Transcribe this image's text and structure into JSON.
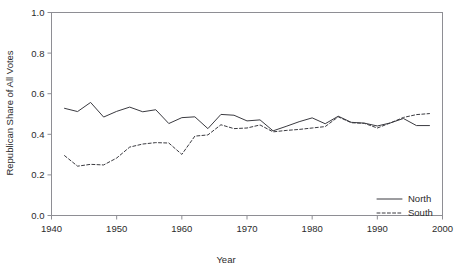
{
  "chart_data": {
    "type": "line",
    "title": "",
    "xlabel": "Year",
    "ylabel": "Republican  Share of All Votes",
    "xlim": [
      1940,
      2000
    ],
    "ylim": [
      0.0,
      1.0
    ],
    "xticks": [
      1940,
      1950,
      1960,
      1970,
      1980,
      1990,
      2000
    ],
    "xticklabels": [
      "1940",
      "1950",
      "1960",
      "1970",
      "1980",
      "1990",
      "2000"
    ],
    "yticks": [
      0.0,
      0.2,
      0.4,
      0.6,
      0.8,
      1.0
    ],
    "yticklabels": [
      "0.0",
      "0.2",
      "0.4",
      "0.6",
      "0.8",
      "1.0"
    ],
    "grid": false,
    "legend_position": "bottom-right",
    "line_color": "#3a3a40",
    "axis_color": "#8e8e94",
    "x": [
      1942,
      1944,
      1946,
      1948,
      1950,
      1952,
      1954,
      1956,
      1958,
      1960,
      1962,
      1964,
      1966,
      1968,
      1970,
      1972,
      1974,
      1976,
      1978,
      1980,
      1982,
      1984,
      1986,
      1988,
      1990,
      1992,
      1994,
      1996,
      1998
    ],
    "series": [
      {
        "name": "North",
        "style": "solid",
        "values": [
          0.528,
          0.512,
          0.557,
          0.485,
          0.513,
          0.534,
          0.511,
          0.521,
          0.453,
          0.482,
          0.486,
          0.428,
          0.498,
          0.494,
          0.466,
          0.471,
          0.417,
          0.439,
          0.462,
          0.481,
          0.452,
          0.489,
          0.459,
          0.455,
          0.441,
          0.456,
          0.478,
          0.443,
          0.443
        ]
      },
      {
        "name": "South",
        "style": "dashed",
        "values": [
          0.295,
          0.243,
          0.252,
          0.249,
          0.283,
          0.337,
          0.352,
          0.359,
          0.357,
          0.301,
          0.391,
          0.397,
          0.447,
          0.428,
          0.431,
          0.446,
          0.412,
          0.419,
          0.424,
          0.431,
          0.438,
          0.486,
          0.457,
          0.454,
          0.431,
          0.456,
          0.483,
          0.497,
          0.502
        ]
      }
    ]
  },
  "legend": {
    "entries": [
      {
        "label": "North",
        "style": "solid"
      },
      {
        "label": "South",
        "style": "dashed"
      }
    ]
  }
}
